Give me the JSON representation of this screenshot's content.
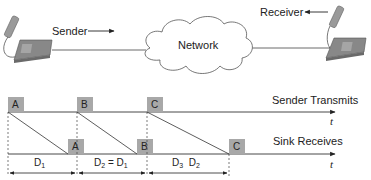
{
  "top": {
    "sender_label": "Sender",
    "receiver_label": "Receiver",
    "network_label": "Network"
  },
  "timeline": {
    "sender_track_label": "Sender Transmits",
    "sink_track_label": "Sink Receives",
    "time_symbol": "t",
    "packets_sent": [
      "A",
      "B",
      "C"
    ],
    "packets_received": [
      "A",
      "B",
      "C"
    ],
    "delays": [
      {
        "main": "D",
        "sub": "1",
        "rest": ""
      },
      {
        "main": "D",
        "sub": "2",
        "rest": " = D",
        "sub2": "1"
      },
      {
        "main": "D",
        "sub": "3",
        "rest": "  D",
        "sub2": "2"
      }
    ]
  },
  "colors": {
    "packet_fill": "#a8a8a8",
    "phone_fill": "#8a8a8a",
    "line": "#333333"
  }
}
